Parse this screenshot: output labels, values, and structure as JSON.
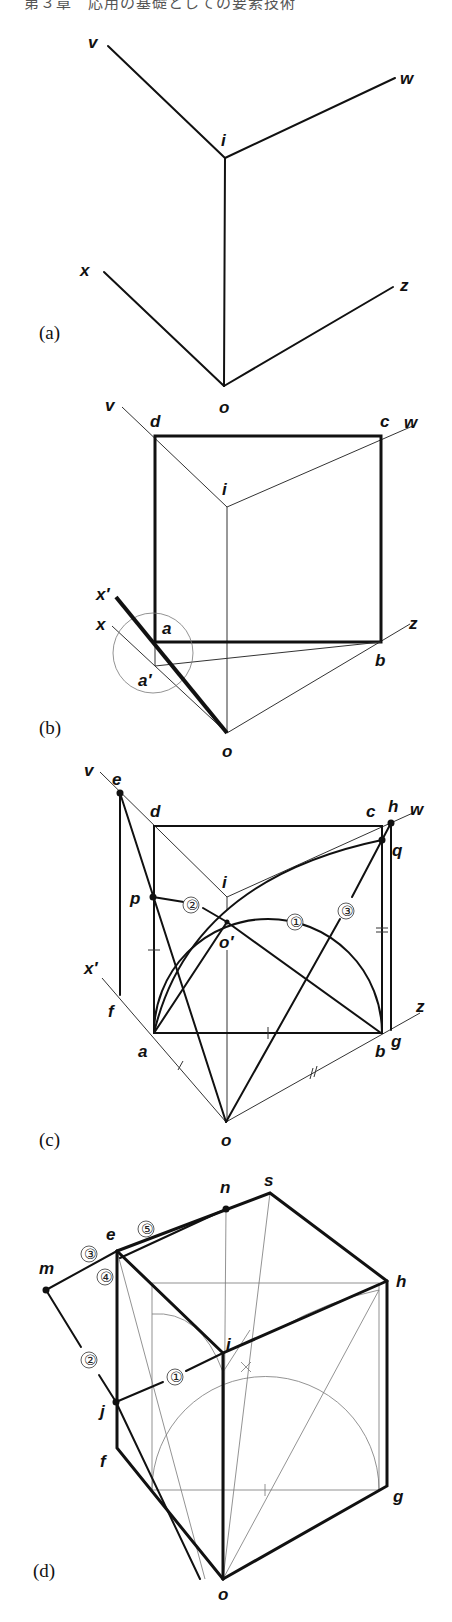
{
  "header": {
    "text": "第３章　応用の基礎としての要素技術"
  },
  "panels": {
    "a": {
      "caption": "(a)",
      "points": {
        "v": "v",
        "w": "w",
        "i": "i",
        "x": "x",
        "z": "z",
        "o": "o"
      }
    },
    "b": {
      "caption": "(b)",
      "points": {
        "v": "v",
        "d": "d",
        "c": "c",
        "w": "w",
        "i": "i",
        "x_prime": "x′",
        "x": "x",
        "a": "a",
        "a_prime": "a′",
        "z": "z",
        "b": "b",
        "o": "o"
      }
    },
    "c": {
      "caption": "(c)",
      "points": {
        "v": "v",
        "e": "e",
        "d": "d",
        "c": "c",
        "h": "h",
        "w": "w",
        "q": "q",
        "i": "i",
        "p": "p",
        "o_prime": "o′",
        "x_prime": "x′",
        "f": "f",
        "a": "a",
        "b": "b",
        "g": "g",
        "z": "z",
        "o": "o"
      },
      "steps": {
        "s1": "①",
        "s2": "②",
        "s3": "③"
      },
      "marks": {
        "single": "+",
        "double": "="
      }
    },
    "d": {
      "caption": "(d)",
      "points": {
        "n": "n",
        "s": "s",
        "e": "e",
        "m": "m",
        "h": "h",
        "i": "i",
        "j": "j",
        "f": "f",
        "g": "g",
        "o": "o"
      },
      "steps": {
        "s1": "①",
        "s2": "②",
        "s3": "③",
        "s4": "④",
        "s5": "⑤"
      }
    }
  }
}
